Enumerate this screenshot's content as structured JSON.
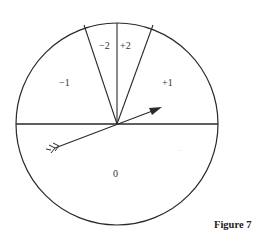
{
  "figure": {
    "caption": "Figure 7",
    "regions": [
      {
        "id": "minus2",
        "label": "−2"
      },
      {
        "id": "plus2",
        "label": "+2"
      },
      {
        "id": "minus1",
        "label": "−1"
      },
      {
        "id": "plus1",
        "label": "+1"
      },
      {
        "id": "zero",
        "label": "0"
      }
    ],
    "colors": {
      "stroke": "#2a2a2a",
      "background": "#ffffff"
    }
  }
}
